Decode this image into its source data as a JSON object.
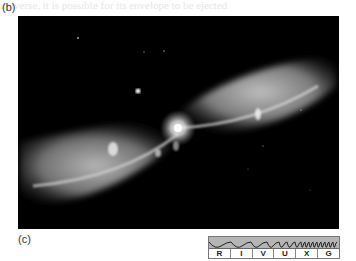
{
  "panel_b": {
    "label": "(b)"
  },
  "panel_c": {
    "label": "(c)"
  },
  "photo": {
    "subject": "bipolar nebula (hourglass-shaped gas lobes with bright central star)",
    "colors": {
      "background": "#000000",
      "glow": "#ffffff"
    }
  },
  "spectrum_bar": {
    "bands": [
      "R",
      "I",
      "V",
      "U",
      "X",
      "G"
    ],
    "highlight_color": "#b5b5b5"
  },
  "bleed_text": "universe, it is possible for its envelope to be ejected"
}
